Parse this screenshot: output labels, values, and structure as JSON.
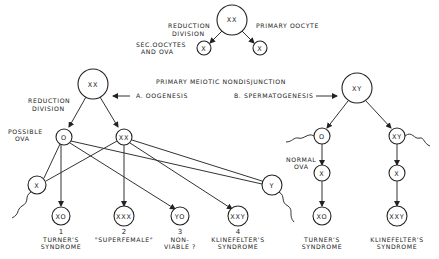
{
  "top": {
    "primary_oocyte": "XX",
    "primary_oocyte_label": "PRIMARY OOCYTE",
    "reduction_line1": "REDUCTION",
    "reduction_line2": "DIVISION",
    "sec_line1": "SEC.OOCYTES",
    "sec_line2": "AND OVA",
    "left_child": "X",
    "right_child": "X"
  },
  "heading": "PRIMARY MEIOTIC NONDISJUNCTION",
  "oogenesis": {
    "title": "A. OOGENESIS",
    "root": "XX",
    "reduction_line1": "REDUCTION",
    "reduction_line2": "DIVISION",
    "possible_line1": "POSSIBLE",
    "possible_line2": "OVA",
    "ovum_left": "O",
    "ovum_right": "XX",
    "sperm_x": "X",
    "sperm_y": "Y",
    "outcomes": [
      {
        "karyotype": "XO",
        "number": "1",
        "line1": "TURNER'S",
        "line2": "SYNDROME"
      },
      {
        "karyotype": "XXX",
        "number": "2",
        "line1": "\"SUPERFEMALE\"",
        "line2": ""
      },
      {
        "karyotype": "YO",
        "number": "3",
        "line1": "NON-",
        "line2": "VIABLE ?"
      },
      {
        "karyotype": "XXY",
        "number": "4",
        "line1": "KLINEFELTER'S",
        "line2": "SYNDROME"
      }
    ]
  },
  "spermatogenesis": {
    "title": "B. SPERMATOGENESIS",
    "root": "XY",
    "sperm_left": "O",
    "sperm_right": "XY",
    "normal_line1": "NORMAL",
    "normal_line2": "OVA",
    "ovum_left": "X",
    "ovum_right": "X",
    "outcomes": [
      {
        "karyotype": "XO",
        "line1": "TURNER'S",
        "line2": "SYNDROME"
      },
      {
        "karyotype": "XXY",
        "line1": "KLINEFELTER'S",
        "line2": "SYNDROME"
      }
    ]
  }
}
